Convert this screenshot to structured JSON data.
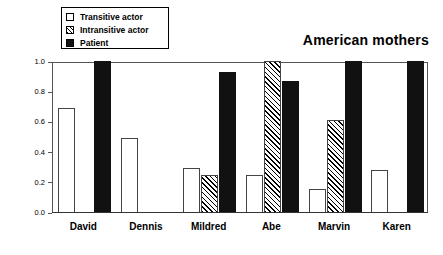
{
  "chart_data": {
    "type": "bar",
    "title": "American mothers",
    "xlabel": "",
    "ylabel": "Probability of production",
    "ylim": [
      0.0,
      1.0
    ],
    "yticks": [
      0.0,
      0.2,
      0.4,
      0.6,
      0.8,
      1.0
    ],
    "ytick_labels": [
      "0.0",
      "0.2",
      "0.4",
      "0.6",
      "0.8",
      "1.0"
    ],
    "grid": false,
    "legend_position": "top-left",
    "categories": [
      "David",
      "Dennis",
      "Mildred",
      "Abe",
      "Marvin",
      "Karen"
    ],
    "series": [
      {
        "name": "Transitive actor",
        "style": "open",
        "values": [
          0.69,
          0.49,
          0.29,
          0.245,
          0.15,
          0.275
        ]
      },
      {
        "name": "Intransitive actor",
        "style": "hatched",
        "values": [
          null,
          null,
          0.245,
          1.0,
          0.61,
          null
        ]
      },
      {
        "name": "Patient",
        "style": "solid",
        "values": [
          1.0,
          null,
          0.93,
          0.865,
          1.0,
          1.0
        ]
      }
    ]
  },
  "legend": {
    "items": [
      {
        "label": "Transitive actor",
        "swatch": "open-square-icon"
      },
      {
        "label": "Intransitive actor",
        "swatch": "hatched-square-icon"
      },
      {
        "label": "Patient",
        "swatch": "solid-square-icon"
      }
    ]
  }
}
